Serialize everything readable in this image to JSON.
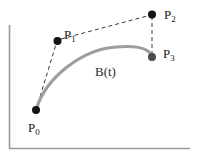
{
  "figure": {
    "background_color": "#ffffff",
    "width": 200,
    "height": 157
  },
  "axes": {
    "color": "#9a9a9a",
    "y_axis": {
      "name": "y-axis",
      "x": 9.5,
      "y_top": 25,
      "y_bottom": 148
    },
    "x_axis": {
      "name": "x-axis",
      "y": 148.5,
      "x_left": 9,
      "x_right": 190
    }
  },
  "curve": {
    "label": "B(t)",
    "color": "#9e9e9e",
    "stroke_width": 3.2,
    "path": "M 36 110 C 46 76 84 49 116 47 C 140 45 150 49 152 57"
  },
  "control_polygon": {
    "color": "#3a3a3a",
    "stroke_width": 1,
    "dash": "4,3",
    "segments": [
      {
        "name": "p0-p1",
        "x1": 36,
        "y1": 110,
        "x2": 57,
        "y2": 41
      },
      {
        "name": "p1-p2",
        "x1": 61,
        "y1": 39,
        "x2": 151,
        "y2": 15
      },
      {
        "name": "p2-p3",
        "x1": 152,
        "y1": 16,
        "x2": 152,
        "y2": 56
      }
    ]
  },
  "points": [
    {
      "id": "p0",
      "label_base": "P",
      "label_sub": "0",
      "x": 36,
      "y": 110,
      "r": 4.0,
      "color": "#141414"
    },
    {
      "id": "p1",
      "label_base": "P",
      "label_sub": "1",
      "x": 57.5,
      "y": 41,
      "r": 4.0,
      "color": "#141414"
    },
    {
      "id": "p2",
      "label_base": "P",
      "label_sub": "2",
      "x": 152,
      "y": 14.5,
      "r": 4.0,
      "color": "#141414"
    },
    {
      "id": "p3",
      "label_base": "P",
      "label_sub": "3",
      "x": 152,
      "y": 57,
      "r": 4.0,
      "color": "#4a4a4a"
    }
  ],
  "labels": {
    "p0": {
      "base": "P",
      "sub": "0"
    },
    "p1": {
      "base": "P",
      "sub": "1"
    },
    "p2": {
      "base": "P",
      "sub": "2"
    },
    "p3": {
      "base": "P",
      "sub": "3"
    },
    "curve": "B(t)"
  }
}
